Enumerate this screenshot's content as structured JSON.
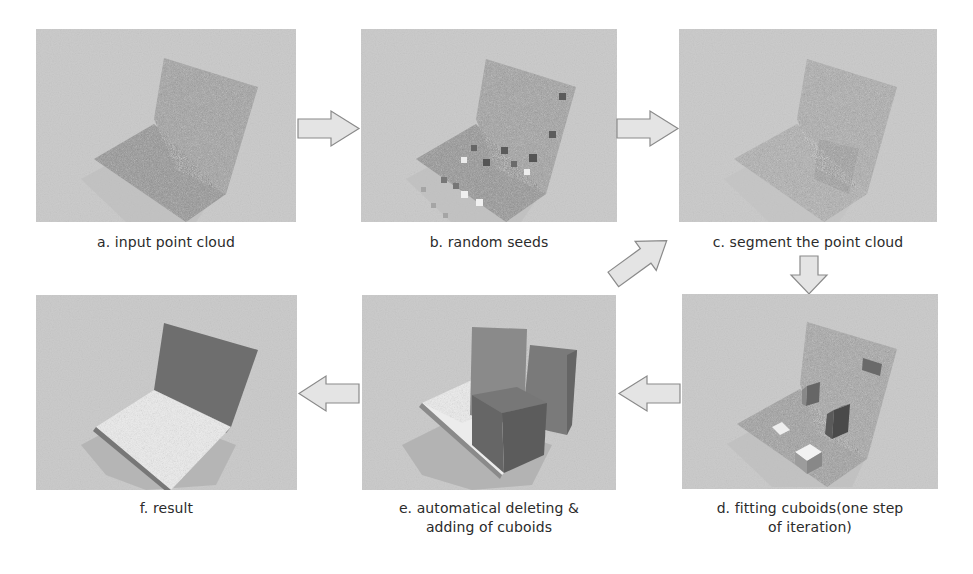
{
  "figure": {
    "steps": [
      {
        "id": "a",
        "label": "a. input point cloud",
        "content": "noisy point cloud of a chair"
      },
      {
        "id": "b",
        "label": "b. random seeds",
        "content": "point cloud with small random seed cubes"
      },
      {
        "id": "c",
        "label": "c. segment the point cloud",
        "content": "segmented point cloud"
      },
      {
        "id": "d",
        "label_line1": "d. fitting cuboids(one step",
        "label_line2": "of iteration)",
        "content": "point cloud with several fitted cuboids"
      },
      {
        "id": "e",
        "label_line1": "e. automatical deleting &",
        "label_line2": "adding of cuboids",
        "content": "overlapping large cuboids over point cloud"
      },
      {
        "id": "f",
        "label": "f. result",
        "content": "final two-cuboid chair (seat and back)"
      }
    ],
    "flow": [
      {
        "from": "a",
        "to": "b",
        "direction": "right"
      },
      {
        "from": "b",
        "to": "c",
        "direction": "right"
      },
      {
        "from": "c",
        "to": "d",
        "direction": "down"
      },
      {
        "from": "d",
        "to": "e",
        "direction": "left"
      },
      {
        "from": "e",
        "to": "c",
        "direction": "up-right"
      },
      {
        "from": "e",
        "to": "f",
        "direction": "left"
      }
    ],
    "colors": {
      "panel_bg": "#c9c9c9",
      "point_cloud": "#9a9a9a",
      "arrow_fill": "#e4e4e4",
      "arrow_stroke": "#8a8a8a",
      "cuboid_dark": "#6e6e6e",
      "cuboid_light": "#f0f0f0"
    }
  }
}
